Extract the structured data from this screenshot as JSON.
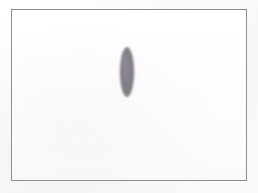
{
  "scene": {
    "title": "Drawing canvas",
    "width": 258,
    "height": 193,
    "background_color": "#fdfdfd",
    "outside_color": "#fbfbfc"
  },
  "frame": {
    "name": "canvas-frame",
    "border_color": "#8e8e92",
    "border_width_px": 1,
    "fill_color": "#fcfcfc",
    "x": 11,
    "y": 9,
    "width": 236,
    "height": 172
  },
  "shapes": [
    {
      "name": "vertical-ellipse",
      "type": "ellipse",
      "fill_color": "#7d7580",
      "edge": "soft",
      "center_x": 127,
      "center_y": 72,
      "radius_x": 7,
      "radius_y": 25,
      "width": 15,
      "height": 50,
      "orientation": "vertical",
      "opacity": 0.92
    }
  ]
}
